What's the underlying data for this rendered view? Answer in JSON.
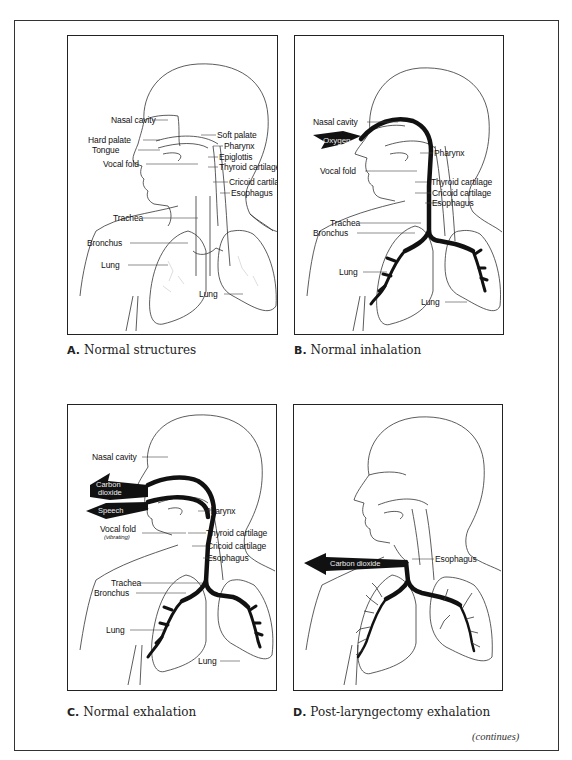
{
  "figure": {
    "panels": [
      {
        "id": "A",
        "caption_letter": "A.",
        "caption_text": "Normal structures",
        "labels": {
          "nasal_cavity": "Nasal cavity",
          "hard_palate": "Hard palate",
          "tongue": "Tongue",
          "vocal_fold": "Vocal fold",
          "soft_palate": "Soft palate",
          "pharynx": "Pharynx",
          "epiglottis": "Epiglottis",
          "thyroid_cartilage": "Thyroid cartilage",
          "cricoid_cartilage": "Cricoid cartilage",
          "esophagus": "Esophagus",
          "trachea": "Trachea",
          "bronchus": "Bronchus",
          "lung_left": "Lung",
          "lung_right": "Lung"
        }
      },
      {
        "id": "B",
        "caption_letter": "B.",
        "caption_text": "Normal inhalation",
        "arrow_labels": {
          "oxygen": "Oxygen"
        },
        "labels": {
          "nasal_cavity": "Nasal cavity",
          "pharynx": "Pharynx",
          "vocal_fold": "Vocal fold",
          "thyroid_cartilage": "Thyroid cartilage",
          "cricoid_cartilage": "Cricoid cartilage",
          "esophagus": "Esophagus",
          "trachea": "Trachea",
          "bronchus": "Bronchus",
          "lung_left": "Lung",
          "lung_right": "Lung"
        }
      },
      {
        "id": "C",
        "caption_letter": "C.",
        "caption_text": "Normal exhalation",
        "arrow_labels": {
          "carbon": "Carbon",
          "dioxide": "dioxide",
          "speech": "Speech"
        },
        "labels": {
          "nasal_cavity": "Nasal cavity",
          "pharynx": "Pharynx",
          "vocal_fold": "Vocal fold",
          "vocal_fold_note": "(vibrating)",
          "thyroid_cartilage": "Thyroid cartilage",
          "cricoid_cartilage": "Cricoid cartilage",
          "esophagus": "Esophagus",
          "trachea": "Trachea",
          "bronchus": "Bronchus",
          "lung_left": "Lung",
          "lung_right": "Lung"
        }
      },
      {
        "id": "D",
        "caption_letter": "D.",
        "caption_text": "Post-laryngectomy exhalation",
        "arrow_labels": {
          "carbon_dioxide": "Carbon dioxide"
        },
        "labels": {
          "esophagus": "Esophagus"
        }
      }
    ],
    "footer": {
      "continues": "(continues)"
    },
    "colors": {
      "line": "#222222",
      "airflow": "#111111",
      "background": "#ffffff"
    }
  }
}
